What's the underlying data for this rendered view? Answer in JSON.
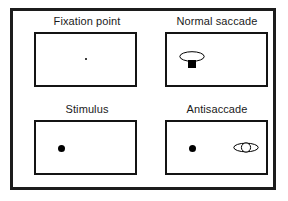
{
  "figure": {
    "frame_color": "#1c1c1c",
    "background_color": "#ffffff",
    "mark_color": "#000000"
  },
  "panels": [
    {
      "id": "fixation",
      "label": "Fixation point",
      "marks": [
        {
          "name": "fixation-point-dot",
          "type": "small-dot",
          "position": "center",
          "color": "#000000"
        }
      ]
    },
    {
      "id": "normal",
      "label": "Normal saccade",
      "marks": [
        {
          "name": "eye-symbol",
          "type": "eye",
          "position": "left",
          "color": "#000000",
          "pupil": "filled"
        },
        {
          "name": "target-dot",
          "type": "square-dot",
          "position": "left",
          "color": "#000000"
        }
      ]
    },
    {
      "id": "stimulus",
      "label": "Stimulus",
      "marks": [
        {
          "name": "stimulus-dot",
          "type": "large-dot",
          "position": "left",
          "color": "#000000"
        }
      ]
    },
    {
      "id": "antisaccade",
      "label": "Antisaccade",
      "marks": [
        {
          "name": "stimulus-dot",
          "type": "large-dot",
          "position": "left",
          "color": "#000000"
        },
        {
          "name": "eye-symbol",
          "type": "eye",
          "position": "right",
          "color": "#000000",
          "pupil": "open"
        }
      ]
    }
  ]
}
